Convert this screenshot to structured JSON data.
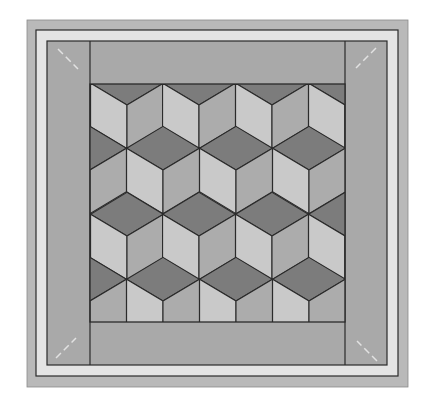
{
  "colors": {
    "background": "#ffffff",
    "outer_border": "#b9b9b9",
    "light_band": "#e4e4e4",
    "side_border": "#a9a9a9",
    "top_bottom_band": "#a9a9a9",
    "block_top": "#7c7c7c",
    "block_left": "#c9c9c9",
    "block_right": "#acacac",
    "line": "#2a2a2a",
    "corner_mark": "#e2e2e2"
  },
  "frame": {
    "outer": {
      "x": 27,
      "y": 20,
      "w": 381,
      "h": 367
    },
    "line_rect": {
      "x": 36,
      "y": 30,
      "w": 362,
      "h": 346
    },
    "inner_panel": {
      "x": 47,
      "y": 41,
      "w": 340,
      "h": 324
    },
    "center": {
      "x": 90,
      "y": 84,
      "w": 255,
      "h": 238
    }
  },
  "pattern": {
    "name": "tumbling blocks",
    "half_width": 36.43,
    "half_height": 21.8,
    "rows": [
      {
        "cy": 40,
        "cx": [
          90,
          163,
          236,
          309,
          382
        ]
      },
      {
        "cy": 105,
        "cx": [
          54,
          127,
          199,
          272,
          345
        ]
      },
      {
        "cy": 170,
        "cx": [
          90,
          163,
          236,
          309,
          382
        ]
      },
      {
        "cy": 236,
        "cx": [
          54,
          127,
          199,
          272,
          345
        ]
      },
      {
        "cy": 301,
        "cx": [
          90,
          163,
          236,
          309,
          382
        ]
      }
    ]
  },
  "corner_marks": [
    {
      "name": "top-left",
      "x1": 58,
      "y1": 49,
      "x2": 78,
      "y2": 69
    },
    {
      "name": "top-right",
      "x1": 376,
      "y1": 48,
      "x2": 356,
      "y2": 68
    },
    {
      "name": "bottom-left",
      "x1": 56,
      "y1": 358,
      "x2": 76,
      "y2": 338
    },
    {
      "name": "bottom-right",
      "x1": 377,
      "y1": 361,
      "x2": 357,
      "y2": 341
    }
  ]
}
